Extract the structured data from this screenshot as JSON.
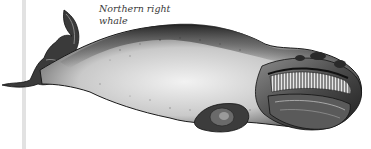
{
  "figure": {
    "caption_line1": "Northern right",
    "caption_line2": "whale",
    "colors": {
      "ink": "#1a1a1a",
      "mid": "#6a6a6a",
      "light": "#d8d8d8",
      "rule": "#e2e2e2",
      "background": "#ffffff"
    }
  }
}
